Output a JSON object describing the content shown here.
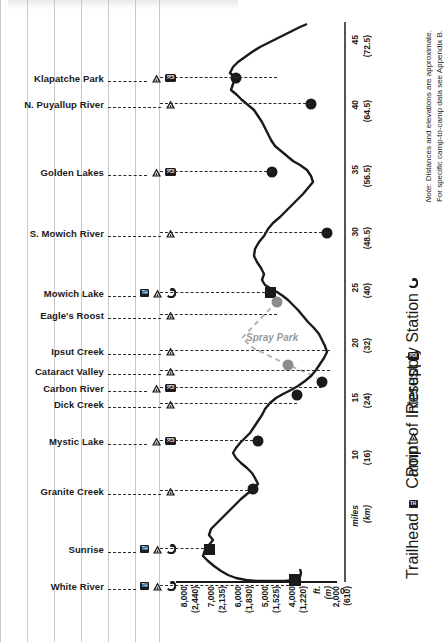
{
  "chart_data": {
    "type": "line",
    "orientation": "vertical-distance",
    "xlabel": "ft. (m)",
    "ylabel": "miles (km)",
    "xlim": [
      2000,
      8000
    ],
    "ylim": [
      0,
      48
    ],
    "grid": true,
    "legend_position": "right",
    "elevation_ticks": [
      {
        "ft": "8,000",
        "m": "(2,440)"
      },
      {
        "ft": "7,000",
        "m": "(2,135)"
      },
      {
        "ft": "6,000",
        "m": "(1,830)"
      },
      {
        "ft": "5,000",
        "m": "(1,525)"
      },
      {
        "ft": "4,000",
        "m": "(1,220)"
      },
      {
        "ft": "ft.",
        "m": "(m)"
      },
      {
        "ft": "2,000",
        "m": "(610)"
      }
    ],
    "zero_label": "0",
    "mile_ticks": [
      {
        "mi": "45",
        "km": "(72.5)"
      },
      {
        "mi": "40",
        "km": "(64.5)"
      },
      {
        "mi": "35",
        "km": "(56.5)"
      },
      {
        "mi": "30",
        "km": "(48.5)"
      },
      {
        "mi": "25",
        "km": "(40)"
      },
      {
        "mi": "20",
        "km": "(32)"
      },
      {
        "mi": "15",
        "km": "(24)"
      },
      {
        "mi": "10",
        "km": "(16)"
      },
      {
        "mi": "miles",
        "km": "(km)"
      }
    ],
    "alt_route_label": "Spray Park",
    "stops": [
      {
        "label": "Klapatche Park",
        "mile": 42.0,
        "elev_ft": 5500,
        "icons": [
          "camp",
          "poi"
        ],
        "marker": "circle"
      },
      {
        "label": "N. Puyallup River",
        "mile": 39.3,
        "elev_ft": 3700,
        "icons": [
          "camp"
        ],
        "marker": "circle"
      },
      {
        "label": "Golden Lakes",
        "mile": 34.5,
        "elev_ft": 4900,
        "icons": [
          "camp",
          "poi"
        ],
        "marker": "circle"
      },
      {
        "label": "S. Mowich River",
        "mile": 30.0,
        "elev_ft": 2900,
        "icons": [
          "camp"
        ],
        "marker": "circle"
      },
      {
        "label": "Mowich Lake",
        "mile": 24.7,
        "elev_ft": 4950,
        "icons": [
          "th",
          "camp",
          "resupply"
        ],
        "marker": "square"
      },
      {
        "label": "Eagle's Roost",
        "mile": 23.2,
        "elev_ft": 4800,
        "icons": [
          "camp"
        ],
        "marker": "circle-alt"
      },
      {
        "label": "Ipsut Creek",
        "mile": 20.0,
        "elev_ft": 2300,
        "icons": [
          "camp"
        ],
        "marker": "none"
      },
      {
        "label": "Cataract Valley",
        "mile": 18.5,
        "elev_ft": 4000,
        "icons": [
          "camp"
        ],
        "marker": "circle-alt"
      },
      {
        "label": "Carbon River",
        "mile": 16.8,
        "elev_ft": 3000,
        "icons": [
          "camp",
          "poi"
        ],
        "marker": "circle"
      },
      {
        "label": "Dick Creek",
        "mile": 15.6,
        "elev_ft": 3700,
        "icons": [
          "camp"
        ],
        "marker": "circle"
      },
      {
        "label": "Mystic Lake",
        "mile": 11.6,
        "elev_ft": 5700,
        "icons": [
          "camp",
          "poi"
        ],
        "marker": "circle"
      },
      {
        "label": "Granite Creek",
        "mile": 8.2,
        "elev_ft": 5800,
        "icons": [
          "camp"
        ],
        "marker": "circle"
      },
      {
        "label": "Sunrise",
        "mile": 3.6,
        "elev_ft": 6400,
        "icons": [
          "th",
          "camp",
          "resupply"
        ],
        "marker": "square"
      },
      {
        "label": "White River",
        "mile": 0.0,
        "elev_ft": 4300,
        "icons": [
          "th",
          "camp",
          "resupply"
        ],
        "marker": "square"
      }
    ]
  },
  "legend": {
    "items": [
      {
        "icon": "resupply-icon",
        "label": "Resupply Station"
      },
      {
        "icon": "poi-icon",
        "label": "Point of Interest"
      },
      {
        "icon": "camp-icon",
        "label": "Camp"
      },
      {
        "icon": "trailhead-icon",
        "label": "Trailhead"
      }
    ]
  },
  "note": {
    "line1_italic": "Note:",
    "line1": " Distances and elevations are approximate.",
    "line2": "For specific camp-to-camp data see Appendix B."
  },
  "icon_text": {
    "th": "TH",
    "poi": "POI"
  },
  "colors": {
    "line": "#1a1a1a",
    "alt_route": "#b4b4b4",
    "alt_marker": "#8c8c8c",
    "grid": "#c9c9c9",
    "leader": "#2b2b2b"
  }
}
